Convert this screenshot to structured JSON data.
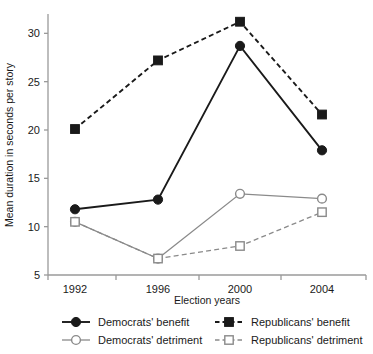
{
  "chart_data": {
    "type": "line",
    "title": "",
    "subtitle": "",
    "xlabel": "Election years",
    "ylabel": "Mean duration in seconds per story",
    "categories": [
      "1992",
      "1996",
      "2000",
      "2004"
    ],
    "x": [
      1992,
      1996,
      2000,
      2004
    ],
    "ylim": [
      5,
      32
    ],
    "xlim": [
      1990,
      2006
    ],
    "yticks": [
      5,
      10,
      15,
      20,
      25,
      30
    ],
    "ytick_labels": [
      "5",
      "10",
      "15",
      "20",
      "25",
      "30"
    ],
    "xtick_labels": [
      "1992",
      "1996",
      "2000",
      "2004"
    ],
    "grid": false,
    "legend_position": "bottom",
    "series": [
      {
        "name": "Democrats' benefit",
        "values": [
          11.8,
          12.8,
          28.7,
          17.9
        ],
        "marker": "filled-circle",
        "linestyle": "solid",
        "color": "#1a1a1a"
      },
      {
        "name": "Republicans' benefit",
        "values": [
          20.1,
          27.2,
          31.2,
          21.6
        ],
        "marker": "filled-square",
        "linestyle": "dashed",
        "color": "#1a1a1a"
      },
      {
        "name": "Democrats' detriment",
        "values": [
          10.5,
          6.7,
          13.4,
          12.9
        ],
        "marker": "open-circle",
        "linestyle": "solid",
        "color": "#8a8a8a"
      },
      {
        "name": "Republicans' detriment",
        "values": [
          10.5,
          6.7,
          8.0,
          11.5
        ],
        "marker": "open-square",
        "linestyle": "dashed",
        "color": "#8a8a8a"
      }
    ]
  },
  "axes": {
    "y_title": "Mean duration in seconds per story",
    "x_title": "Election years",
    "y_tick_0": "5",
    "y_tick_1": "10",
    "y_tick_2": "15",
    "y_tick_3": "20",
    "y_tick_4": "25",
    "y_tick_5": "30",
    "x_tick_0": "1992",
    "x_tick_1": "1996",
    "x_tick_2": "2000",
    "x_tick_3": "2004"
  },
  "legend": {
    "items": [
      {
        "label": "Democrats' benefit",
        "marker": "filled-circle",
        "linestyle": "solid",
        "color": "#1a1a1a"
      },
      {
        "label": "Republicans' benefit",
        "marker": "filled-square",
        "linestyle": "dashed",
        "color": "#1a1a1a"
      },
      {
        "label": "Democrats' detriment",
        "marker": "open-circle",
        "linestyle": "solid",
        "color": "#8a8a8a"
      },
      {
        "label": "Republicans' detriment",
        "marker": "open-square",
        "linestyle": "dashed",
        "color": "#8a8a8a"
      }
    ],
    "item_0_label": "Democrats' benefit",
    "item_1_label": "Republicans' benefit",
    "item_2_label": "Democrats' detriment",
    "item_3_label": "Republicans' detriment"
  },
  "colors": {
    "dark": "#1a1a1a",
    "gray": "#8a8a8a",
    "axis": "#8a8a8a",
    "background": "#ffffff"
  }
}
